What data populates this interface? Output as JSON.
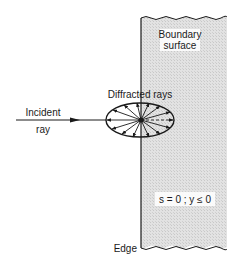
{
  "diagram": {
    "labels": {
      "boundary_line1": "Boundary",
      "boundary_line2": "surface",
      "diffracted": "Diffracted rays",
      "incident_line1": "Incident",
      "incident_line2": "ray",
      "condition": "s = 0 ; y ≤ 0",
      "edge": "Edge"
    },
    "colors": {
      "ink": "#1a1a1a",
      "surface_fill": "#dcdcdc",
      "background": "#ffffff"
    }
  }
}
